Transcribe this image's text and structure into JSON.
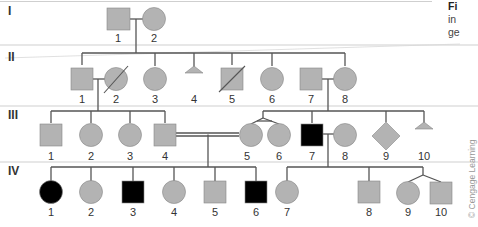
{
  "figure": {
    "caption_fragments": [
      "Fi",
      "in",
      "ge"
    ],
    "credit": "© Cengage Learning",
    "colors": {
      "unaffected_fill": "#b3b3b3",
      "affected_fill": "#000000",
      "line": "#555555",
      "divider": "#cfcfcf"
    }
  },
  "generations": [
    {
      "label": "I",
      "individuals": [
        {
          "n": "1",
          "sex": "male",
          "status": "unaffected"
        },
        {
          "n": "2",
          "sex": "female",
          "status": "unaffected"
        }
      ]
    },
    {
      "label": "II",
      "individuals": [
        {
          "n": "1",
          "sex": "male",
          "status": "unaffected"
        },
        {
          "n": "2",
          "sex": "female",
          "status": "deceased"
        },
        {
          "n": "3",
          "sex": "female",
          "status": "unaffected"
        },
        {
          "n": "4",
          "sex": "miscarriage",
          "status": "unaffected"
        },
        {
          "n": "5",
          "sex": "male",
          "status": "deceased"
        },
        {
          "n": "6",
          "sex": "female",
          "status": "unaffected"
        },
        {
          "n": "7",
          "sex": "male",
          "status": "unaffected"
        },
        {
          "n": "8",
          "sex": "female",
          "status": "unaffected"
        }
      ]
    },
    {
      "label": "III",
      "individuals": [
        {
          "n": "1",
          "sex": "male",
          "status": "unaffected"
        },
        {
          "n": "2",
          "sex": "female",
          "status": "unaffected"
        },
        {
          "n": "3",
          "sex": "female",
          "status": "unaffected"
        },
        {
          "n": "4",
          "sex": "male",
          "status": "unaffected"
        },
        {
          "n": "5",
          "sex": "female",
          "status": "unaffected",
          "twin": "identical"
        },
        {
          "n": "6",
          "sex": "female",
          "status": "unaffected",
          "twin": "identical"
        },
        {
          "n": "7",
          "sex": "male",
          "status": "affected"
        },
        {
          "n": "8",
          "sex": "female",
          "status": "unaffected"
        },
        {
          "n": "9",
          "sex": "unknown",
          "status": "unaffected"
        },
        {
          "n": "10",
          "sex": "miscarriage",
          "status": "unaffected"
        }
      ]
    },
    {
      "label": "IV",
      "individuals": [
        {
          "n": "1",
          "sex": "female",
          "status": "affected"
        },
        {
          "n": "2",
          "sex": "female",
          "status": "unaffected"
        },
        {
          "n": "3",
          "sex": "male",
          "status": "affected"
        },
        {
          "n": "4",
          "sex": "female",
          "status": "unaffected"
        },
        {
          "n": "5",
          "sex": "male",
          "status": "unaffected"
        },
        {
          "n": "6",
          "sex": "male",
          "status": "affected"
        },
        {
          "n": "7",
          "sex": "female",
          "status": "unaffected"
        },
        {
          "n": "8",
          "sex": "male",
          "status": "unaffected"
        },
        {
          "n": "9",
          "sex": "female",
          "status": "unaffected",
          "twin": "fraternal"
        },
        {
          "n": "10",
          "sex": "male",
          "status": "unaffected",
          "twin": "fraternal"
        }
      ]
    }
  ],
  "relationships": {
    "consanguineous": "III-4 x III-5"
  }
}
